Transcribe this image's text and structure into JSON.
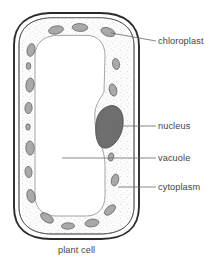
{
  "diagram": {
    "title": "plant cell",
    "caption": "plant cell",
    "type": "biological-cell-cross-section",
    "labels": [
      {
        "id": "chloroplast",
        "text": "chloroplast",
        "leader_from_x": 130,
        "leader_to_x": 155,
        "leader_y": 41,
        "target": "chloroplast-upper-right"
      },
      {
        "id": "nucleus",
        "text": "nucleus",
        "leader_from_x": 112,
        "leader_to_x": 155,
        "leader_y": 126,
        "target": "nucleus-blob"
      },
      {
        "id": "vacuole",
        "text": "vacuole",
        "leader_from_x": 62,
        "leader_to_x": 155,
        "leader_y": 158,
        "target": "vacuole-interior"
      },
      {
        "id": "cytoplasm",
        "text": "cytoplasm",
        "leader_from_x": 118,
        "leader_to_x": 155,
        "leader_y": 187,
        "target": "cytoplasm-band"
      }
    ],
    "structures": {
      "cell_wall": "cell-wall-outline",
      "cell_membrane": "cell-membrane-outline",
      "cytoplasm": "cytoplasm-stippled-band",
      "vacuole": "central-vacuole",
      "nucleus": "nucleus-dark-blob",
      "chloroplasts_count": 17
    },
    "colors": {
      "background": "#ffffff",
      "outline": "#2f2f2f",
      "inner_outline": "#555555",
      "vacuole_outline": "#8a8a8a",
      "cytoplasm_fill": "#fbfbfb",
      "cytoplasm_stipple": "#b8b8b8",
      "chloroplast_fill": "#a9a9a9",
      "chloroplast_stroke": "#636363",
      "nucleus_fill": "#6e6e6e",
      "nucleus_stroke": "#4a4a4a",
      "label_text": "#444444",
      "leader_line": "#666666"
    }
  }
}
